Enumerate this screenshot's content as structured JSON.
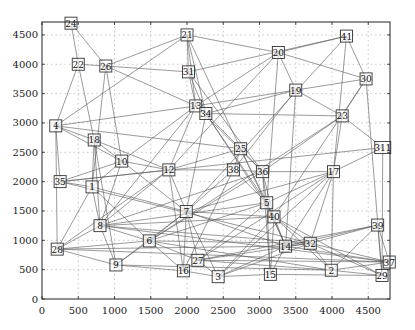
{
  "figure": {
    "title": "",
    "xlabel": "",
    "ylabel": "",
    "xlim": [
      0,
      4800
    ],
    "ylim": [
      0,
      4720
    ],
    "xticks": [
      0,
      500,
      1000,
      1500,
      2000,
      2500,
      3000,
      3500,
      4000,
      4500
    ],
    "yticks": [
      0,
      500,
      1000,
      1500,
      2000,
      2500,
      3000,
      3500,
      4000,
      4500
    ],
    "grid": true,
    "edge_color": "#555555",
    "node_border_color": "#333333"
  },
  "nodes": [
    {
      "id": "24",
      "x": 400,
      "y": 4700
    },
    {
      "id": "22",
      "x": 500,
      "y": 4000
    },
    {
      "id": "26",
      "x": 880,
      "y": 3970
    },
    {
      "id": "21",
      "x": 2000,
      "y": 4500
    },
    {
      "id": "31",
      "x": 2020,
      "y": 3870
    },
    {
      "id": "20",
      "x": 3260,
      "y": 4200
    },
    {
      "id": "41",
      "x": 4200,
      "y": 4480
    },
    {
      "id": "30",
      "x": 4470,
      "y": 3750
    },
    {
      "id": "19",
      "x": 3500,
      "y": 3560
    },
    {
      "id": "13",
      "x": 2120,
      "y": 3290
    },
    {
      "id": "34",
      "x": 2260,
      "y": 3160
    },
    {
      "id": "23",
      "x": 4140,
      "y": 3120
    },
    {
      "id": "4",
      "x": 190,
      "y": 2950
    },
    {
      "id": "18",
      "x": 720,
      "y": 2710
    },
    {
      "id": "311",
      "x": 4700,
      "y": 2580
    },
    {
      "id": "25",
      "x": 2740,
      "y": 2560
    },
    {
      "id": "10",
      "x": 1100,
      "y": 2350
    },
    {
      "id": "12",
      "x": 1750,
      "y": 2200
    },
    {
      "id": "38",
      "x": 2640,
      "y": 2200
    },
    {
      "id": "36",
      "x": 3040,
      "y": 2170
    },
    {
      "id": "17",
      "x": 4020,
      "y": 2170
    },
    {
      "id": "35",
      "x": 250,
      "y": 2000
    },
    {
      "id": "1",
      "x": 690,
      "y": 1910
    },
    {
      "id": "5",
      "x": 3100,
      "y": 1640
    },
    {
      "id": "7",
      "x": 1990,
      "y": 1490
    },
    {
      "id": "40",
      "x": 3200,
      "y": 1400
    },
    {
      "id": "8",
      "x": 800,
      "y": 1250
    },
    {
      "id": "39",
      "x": 4630,
      "y": 1260
    },
    {
      "id": "6",
      "x": 1480,
      "y": 990
    },
    {
      "id": "32",
      "x": 3700,
      "y": 950
    },
    {
      "id": "14",
      "x": 3360,
      "y": 900
    },
    {
      "id": "28",
      "x": 210,
      "y": 850
    },
    {
      "id": "27",
      "x": 2150,
      "y": 660
    },
    {
      "id": "37",
      "x": 4790,
      "y": 630
    },
    {
      "id": "9",
      "x": 1020,
      "y": 580
    },
    {
      "id": "2",
      "x": 3990,
      "y": 490
    },
    {
      "id": "16",
      "x": 1950,
      "y": 480
    },
    {
      "id": "15",
      "x": 3150,
      "y": 420
    },
    {
      "id": "29",
      "x": 4690,
      "y": 400
    },
    {
      "id": "3",
      "x": 2430,
      "y": 380
    }
  ],
  "edges": [
    [
      "24",
      "22"
    ],
    [
      "24",
      "26"
    ],
    [
      "22",
      "26"
    ],
    [
      "22",
      "18"
    ],
    [
      "22",
      "4"
    ],
    [
      "26",
      "21"
    ],
    [
      "26",
      "31"
    ],
    [
      "26",
      "13"
    ],
    [
      "26",
      "10"
    ],
    [
      "26",
      "1"
    ],
    [
      "21",
      "31"
    ],
    [
      "21",
      "20"
    ],
    [
      "21",
      "13"
    ],
    [
      "21",
      "34"
    ],
    [
      "21",
      "25"
    ],
    [
      "21",
      "4"
    ],
    [
      "31",
      "13"
    ],
    [
      "31",
      "34"
    ],
    [
      "31",
      "41"
    ],
    [
      "31",
      "36"
    ],
    [
      "20",
      "41"
    ],
    [
      "20",
      "30"
    ],
    [
      "20",
      "19"
    ],
    [
      "20",
      "5"
    ],
    [
      "20",
      "12"
    ],
    [
      "20",
      "13"
    ],
    [
      "41",
      "30"
    ],
    [
      "41",
      "17"
    ],
    [
      "41",
      "7"
    ],
    [
      "30",
      "23"
    ],
    [
      "30",
      "19"
    ],
    [
      "30",
      "29"
    ],
    [
      "30",
      "40"
    ],
    [
      "19",
      "23"
    ],
    [
      "19",
      "34"
    ],
    [
      "19",
      "14"
    ],
    [
      "19",
      "38"
    ],
    [
      "19",
      "13"
    ],
    [
      "13",
      "34"
    ],
    [
      "13",
      "4"
    ],
    [
      "13",
      "10"
    ],
    [
      "13",
      "12"
    ],
    [
      "13",
      "8"
    ],
    [
      "13",
      "36"
    ],
    [
      "34",
      "25"
    ],
    [
      "34",
      "5"
    ],
    [
      "34",
      "40"
    ],
    [
      "34",
      "7"
    ],
    [
      "34",
      "23"
    ],
    [
      "23",
      "311"
    ],
    [
      "23",
      "17"
    ],
    [
      "23",
      "36"
    ],
    [
      "23",
      "6"
    ],
    [
      "4",
      "18"
    ],
    [
      "4",
      "35"
    ],
    [
      "4",
      "28"
    ],
    [
      "4",
      "10"
    ],
    [
      "4",
      "25"
    ],
    [
      "18",
      "10"
    ],
    [
      "18",
      "1"
    ],
    [
      "18",
      "8"
    ],
    [
      "18",
      "9"
    ],
    [
      "18",
      "12"
    ],
    [
      "311",
      "17"
    ],
    [
      "311",
      "29"
    ],
    [
      "311",
      "35"
    ],
    [
      "25",
      "38"
    ],
    [
      "25",
      "36"
    ],
    [
      "25",
      "5"
    ],
    [
      "25",
      "14"
    ],
    [
      "25",
      "12"
    ],
    [
      "10",
      "12"
    ],
    [
      "10",
      "1"
    ],
    [
      "10",
      "35"
    ],
    [
      "10",
      "8"
    ],
    [
      "10",
      "7"
    ],
    [
      "12",
      "38"
    ],
    [
      "12",
      "7"
    ],
    [
      "12",
      "8"
    ],
    [
      "12",
      "28"
    ],
    [
      "12",
      "16"
    ],
    [
      "12",
      "35"
    ],
    [
      "38",
      "36"
    ],
    [
      "38",
      "5"
    ],
    [
      "38",
      "7"
    ],
    [
      "38",
      "16"
    ],
    [
      "36",
      "17"
    ],
    [
      "36",
      "5"
    ],
    [
      "36",
      "40"
    ],
    [
      "36",
      "15"
    ],
    [
      "36",
      "6"
    ],
    [
      "36",
      "8"
    ],
    [
      "17",
      "5"
    ],
    [
      "17",
      "14"
    ],
    [
      "17",
      "32"
    ],
    [
      "17",
      "2"
    ],
    [
      "17",
      "7"
    ],
    [
      "17",
      "27"
    ],
    [
      "17",
      "3"
    ],
    [
      "35",
      "1"
    ],
    [
      "35",
      "32"
    ],
    [
      "1",
      "8"
    ],
    [
      "1",
      "6"
    ],
    [
      "1",
      "7"
    ],
    [
      "1",
      "28"
    ],
    [
      "5",
      "40"
    ],
    [
      "5",
      "14"
    ],
    [
      "5",
      "15"
    ],
    [
      "5",
      "6"
    ],
    [
      "5",
      "8"
    ],
    [
      "5",
      "27"
    ],
    [
      "7",
      "6"
    ],
    [
      "7",
      "27"
    ],
    [
      "7",
      "16"
    ],
    [
      "7",
      "3"
    ],
    [
      "7",
      "40"
    ],
    [
      "7",
      "9"
    ],
    [
      "7",
      "14"
    ],
    [
      "40",
      "14"
    ],
    [
      "40",
      "32"
    ],
    [
      "40",
      "2"
    ],
    [
      "40",
      "15"
    ],
    [
      "40",
      "8"
    ],
    [
      "40",
      "3"
    ],
    [
      "40",
      "29"
    ],
    [
      "8",
      "6"
    ],
    [
      "8",
      "9"
    ],
    [
      "8",
      "28"
    ],
    [
      "8",
      "32"
    ],
    [
      "8",
      "37"
    ],
    [
      "39",
      "37"
    ],
    [
      "39",
      "29"
    ],
    [
      "39",
      "32"
    ],
    [
      "39",
      "14"
    ],
    [
      "39",
      "27"
    ],
    [
      "39",
      "2"
    ],
    [
      "6",
      "9"
    ],
    [
      "6",
      "27"
    ],
    [
      "6",
      "32"
    ],
    [
      "6",
      "16"
    ],
    [
      "6",
      "28"
    ],
    [
      "6",
      "2"
    ],
    [
      "32",
      "14"
    ],
    [
      "32",
      "2"
    ],
    [
      "32",
      "37"
    ],
    [
      "32",
      "29"
    ],
    [
      "32",
      "3"
    ],
    [
      "32",
      "27"
    ],
    [
      "14",
      "15"
    ],
    [
      "14",
      "37"
    ],
    [
      "14",
      "3"
    ],
    [
      "28",
      "9"
    ],
    [
      "28",
      "37"
    ],
    [
      "28",
      "14"
    ],
    [
      "27",
      "16"
    ],
    [
      "27",
      "3"
    ],
    [
      "27",
      "2"
    ],
    [
      "27",
      "37"
    ],
    [
      "9",
      "16"
    ],
    [
      "9",
      "2"
    ],
    [
      "2",
      "37"
    ],
    [
      "2",
      "29"
    ],
    [
      "16",
      "3"
    ],
    [
      "15",
      "3"
    ],
    [
      "15",
      "29"
    ]
  ]
}
